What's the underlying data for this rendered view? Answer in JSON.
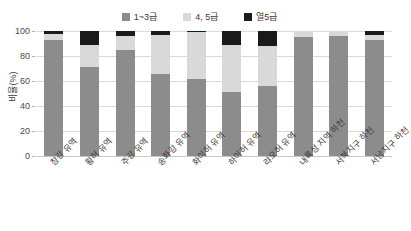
{
  "chart_data": {
    "type": "bar",
    "stacked": true,
    "title": "",
    "xlabel": "",
    "ylabel": "비율(%)",
    "ylim": [
      0,
      100
    ],
    "yticks": [
      0,
      20,
      40,
      60,
      80,
      100
    ],
    "grid": true,
    "legend_position": "top-center",
    "categories": [
      "창강 유역",
      "황허 유역",
      "주강 유역",
      "송화강 유역",
      "화이허 유역",
      "하이허 유역",
      "랴오허 유역",
      "내륙성 지역 하천",
      "서북지구 하천",
      "서남지구 하천"
    ],
    "series": [
      {
        "name": "1~3급",
        "color": "#8c8c8c",
        "values": [
          93,
          71,
          85,
          66,
          62,
          51,
          56,
          95,
          96,
          93
        ]
      },
      {
        "name": "4, 5급",
        "color": "#d9d9d9",
        "values": [
          5,
          18,
          11,
          31,
          37,
          38,
          32,
          5,
          4,
          4
        ]
      },
      {
        "name": "열5급",
        "color": "#1a1a1a",
        "values": [
          2,
          11,
          4,
          3,
          1,
          11,
          12,
          0,
          0,
          3
        ]
      }
    ]
  },
  "legend": {
    "entries": [
      {
        "label": "1~3급",
        "color": "#8c8c8c",
        "swatch_name": "legend-swatch-grade-1-3"
      },
      {
        "label": "4, 5급",
        "color": "#d9d9d9",
        "swatch_name": "legend-swatch-grade-4-5"
      },
      {
        "label": "열5급",
        "color": "#1a1a1a",
        "swatch_name": "legend-swatch-grade-below-5"
      }
    ]
  },
  "axis": {
    "y_title": "비율(%)",
    "y_tick_labels": [
      "100",
      "80",
      "60",
      "40",
      "20",
      "0"
    ]
  },
  "colors": {
    "grade_1_3": "#8c8c8c",
    "grade_4_5": "#d9d9d9",
    "grade_below_5": "#1a1a1a",
    "gridline": "#d9d9d9",
    "text": "#3a3a3a",
    "background": "#ffffff"
  }
}
